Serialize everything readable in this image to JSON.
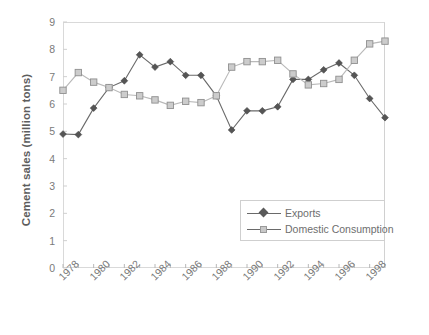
{
  "chart_data": {
    "type": "line",
    "title": "",
    "xlabel": "",
    "ylabel": "Cement sales (million tons)",
    "ylim": [
      0,
      9
    ],
    "xlim": [
      1978,
      1999
    ],
    "grid": false,
    "legend_position": "inside-bottom-right",
    "y_ticks": [
      "9",
      "8",
      "7",
      "6",
      "5",
      "4",
      "3",
      "2",
      "1",
      "0"
    ],
    "x_tick_labels": [
      "1978",
      "1980",
      "1982",
      "1984",
      "1986",
      "1988",
      "1990",
      "1992",
      "1994",
      "1996",
      "1998"
    ],
    "x": [
      1978,
      1979,
      1980,
      1981,
      1982,
      1983,
      1984,
      1985,
      1986,
      1987,
      1988,
      1989,
      1990,
      1991,
      1992,
      1993,
      1994,
      1995,
      1996,
      1997,
      1998,
      1999
    ],
    "series": [
      {
        "name": "Exports",
        "color": "#555555",
        "marker": "diamond",
        "values": [
          4.9,
          4.88,
          5.85,
          6.6,
          6.85,
          7.8,
          7.35,
          7.55,
          7.05,
          7.05,
          6.3,
          5.05,
          5.75,
          5.75,
          5.9,
          6.9,
          6.9,
          7.25,
          7.5,
          7.05,
          6.2,
          5.5
        ]
      },
      {
        "name": "Domestic Consumption",
        "color": "#c4c4c4",
        "marker": "square",
        "values": [
          6.5,
          7.15,
          6.8,
          6.6,
          6.35,
          6.3,
          6.15,
          5.95,
          6.1,
          6.05,
          6.3,
          7.35,
          7.55,
          7.55,
          7.6,
          7.1,
          6.7,
          6.75,
          6.9,
          7.6,
          8.2,
          8.3
        ]
      }
    ]
  },
  "legend": {
    "items": [
      {
        "label": "Exports"
      },
      {
        "label": "Domestic Consumption"
      }
    ]
  }
}
